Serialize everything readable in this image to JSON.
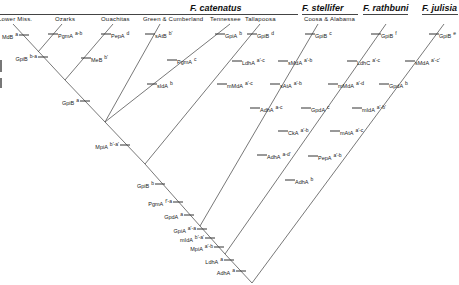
{
  "species": [
    {
      "name": "F. catenatus",
      "x": 190,
      "y": 3
    },
    {
      "name": "F. stellifer",
      "x": 302,
      "y": 3
    },
    {
      "name": "F. rathbuni",
      "x": 363,
      "y": 3
    },
    {
      "name": "F. julisia",
      "x": 422,
      "y": 3
    }
  ],
  "species_rules": [
    {
      "x1": 0,
      "x2": 298,
      "y": 14
    },
    {
      "x1": 302,
      "x2": 358,
      "y": 14
    },
    {
      "x1": 363,
      "x2": 408,
      "y": 14
    },
    {
      "x1": 422,
      "x2": 458,
      "y": 14
    }
  ],
  "populations": [
    {
      "name": "Lower Miss.",
      "x": -2,
      "y": 16
    },
    {
      "name": "Ozarks",
      "x": 55,
      "y": 16
    },
    {
      "name": "Ouachitas",
      "x": 101,
      "y": 16
    },
    {
      "name": "Green & Cumberland",
      "x": 143,
      "y": 16
    },
    {
      "name": "Tennessee",
      "x": 210,
      "y": 16
    },
    {
      "name": "Tallapoosa",
      "x": 245,
      "y": 16
    },
    {
      "name": "Coosa & Alabama",
      "x": 304,
      "y": 16
    }
  ],
  "branches": [
    {
      "id": "lower-miss",
      "x1": 13,
      "y1": 24,
      "x2": 65,
      "y2": 80
    },
    {
      "id": "ozarks",
      "x1": 62,
      "y1": 24,
      "x2": 38,
      "y2": 52
    },
    {
      "id": "ouachitas",
      "x1": 113,
      "y1": 24,
      "x2": 65,
      "y2": 80
    },
    {
      "id": "catenatus-trunk-1",
      "x1": 65,
      "y1": 80,
      "x2": 105,
      "y2": 122
    },
    {
      "id": "green-cumberland",
      "x1": 160,
      "y1": 24,
      "x2": 105,
      "y2": 122
    },
    {
      "id": "tennessee",
      "x1": 230,
      "y1": 24,
      "x2": 105,
      "y2": 122
    },
    {
      "id": "main-trunk-1",
      "x1": 105,
      "y1": 122,
      "x2": 145,
      "y2": 164
    },
    {
      "id": "tallapoosa",
      "x1": 260,
      "y1": 24,
      "x2": 145,
      "y2": 164
    },
    {
      "id": "main-trunk-2",
      "x1": 145,
      "y1": 164,
      "x2": 200,
      "y2": 226
    },
    {
      "id": "coosa-alabama",
      "x1": 318,
      "y1": 24,
      "x2": 200,
      "y2": 226
    },
    {
      "id": "main-trunk-3",
      "x1": 200,
      "y1": 226,
      "x2": 225,
      "y2": 254
    },
    {
      "id": "rathbuni",
      "x1": 386,
      "y1": 24,
      "x2": 225,
      "y2": 254
    },
    {
      "id": "main-trunk-4",
      "x1": 225,
      "y1": 254,
      "x2": 252,
      "y2": 283
    },
    {
      "id": "julisia",
      "x1": 444,
      "y1": 24,
      "x2": 252,
      "y2": 283
    }
  ],
  "markers": [
    {
      "locus": "MdB",
      "allele": "a",
      "x": 24,
      "y": 35,
      "side": "left"
    },
    {
      "locus": "GpiB",
      "allele": "b-a",
      "x": 43,
      "y": 57,
      "side": "left"
    },
    {
      "locus": "PgmA",
      "allele": "a-b",
      "x": 53,
      "y": 34,
      "side": "right"
    },
    {
      "locus": "PepA",
      "allele": "d",
      "x": 106,
      "y": 34,
      "side": "right"
    },
    {
      "locus": "MeB",
      "allele": "b'",
      "x": 86,
      "y": 58,
      "side": "right"
    },
    {
      "locus": "GpiB",
      "allele": "a",
      "x": 85,
      "y": 101,
      "side": "left"
    },
    {
      "locus": "sAtB",
      "allele": "b'",
      "x": 150,
      "y": 34,
      "side": "right"
    },
    {
      "locus": "sIdA",
      "allele": "b",
      "x": 152,
      "y": 84,
      "side": "right"
    },
    {
      "locus": "GpiA",
      "allele": "b",
      "x": 220,
      "y": 34,
      "side": "right"
    },
    {
      "locus": "PgmA",
      "allele": "c",
      "x": 172,
      "y": 60,
      "side": "right"
    },
    {
      "locus": "MpiA",
      "allele": "b'-a'",
      "x": 125,
      "y": 145,
      "side": "left"
    },
    {
      "locus": "GpiB",
      "allele": "d",
      "x": 252,
      "y": 34,
      "side": "right"
    },
    {
      "locus": "LdhA",
      "allele": "a'-c",
      "x": 237,
      "y": 61,
      "side": "right"
    },
    {
      "locus": "mMdA",
      "allele": "a'-c",
      "x": 222,
      "y": 84,
      "side": "right"
    },
    {
      "locus": "AdhA",
      "allele": "a-c",
      "x": 255,
      "y": 108,
      "side": "right"
    },
    {
      "locus": "AdhA",
      "allele": "a-d'",
      "x": 262,
      "y": 155,
      "side": "right"
    },
    {
      "locus": "GpiB",
      "allele": "b",
      "x": 160,
      "y": 184,
      "side": "left"
    },
    {
      "locus": "PgmA",
      "allele": "f'-a",
      "x": 178,
      "y": 202,
      "side": "left"
    },
    {
      "locus": "GpdA",
      "allele": "a",
      "x": 189,
      "y": 215,
      "side": "left"
    },
    {
      "locus": "GpiB",
      "allele": "c",
      "x": 310,
      "y": 34,
      "side": "right"
    },
    {
      "locus": "sMdA",
      "allele": "a'-b",
      "x": 283,
      "y": 61,
      "side": "right"
    },
    {
      "locus": "sAtA",
      "allele": "a'-b",
      "x": 275,
      "y": 84,
      "side": "right"
    },
    {
      "locus": "GpdA",
      "allele": "c",
      "x": 306,
      "y": 108,
      "side": "right"
    },
    {
      "locus": "CkA",
      "allele": "a'-b",
      "x": 283,
      "y": 131,
      "side": "right"
    },
    {
      "locus": "AdhA",
      "allele": "b",
      "x": 290,
      "y": 180,
      "side": "right"
    },
    {
      "locus": "GpiA",
      "allele": "a'-a",
      "x": 202,
      "y": 229,
      "side": "left"
    },
    {
      "locus": "mIdA",
      "allele": "b'-a'",
      "x": 210,
      "y": 238,
      "side": "left"
    },
    {
      "locus": "MpiA",
      "allele": "a'-b",
      "x": 219,
      "y": 247,
      "side": "left"
    },
    {
      "locus": "GpiB",
      "allele": "f",
      "x": 376,
      "y": 34,
      "side": "right"
    },
    {
      "locus": "LdhC",
      "allele": "a'-c",
      "x": 352,
      "y": 61,
      "side": "right"
    },
    {
      "locus": "mMdA",
      "allele": "a'-d",
      "x": 333,
      "y": 84,
      "side": "right"
    },
    {
      "locus": "GpdA",
      "allele": "b",
      "x": 384,
      "y": 84,
      "side": "right"
    },
    {
      "locus": "mIdA",
      "allele": "a'-b'",
      "x": 357,
      "y": 108,
      "side": "right"
    },
    {
      "locus": "mAtA",
      "allele": "a'-c",
      "x": 335,
      "y": 131,
      "side": "right"
    },
    {
      "locus": "PepA",
      "allele": "a'-b",
      "x": 313,
      "y": 156,
      "side": "right"
    },
    {
      "locus": "LdhA",
      "allele": "a",
      "x": 229,
      "y": 260,
      "side": "left"
    },
    {
      "locus": "AdhA",
      "allele": "a",
      "x": 241,
      "y": 271,
      "side": "left"
    },
    {
      "locus": "GpiB",
      "allele": "e",
      "x": 434,
      "y": 34,
      "side": "right"
    },
    {
      "locus": "sMdA",
      "allele": "a'-c'",
      "x": 410,
      "y": 61,
      "side": "right"
    }
  ],
  "colors": {
    "line": "#555555",
    "text": "#222222",
    "background": "#ffffff"
  }
}
